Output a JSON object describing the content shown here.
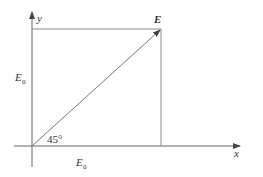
{
  "diagram": {
    "axes": {
      "x_label": "x",
      "y_label": "y"
    },
    "vector": {
      "label": "E",
      "angle_label": "45°"
    },
    "components": {
      "left_label_main": "E",
      "left_label_sub": "0",
      "bottom_label_main": "E",
      "bottom_label_sub": "0"
    },
    "colors": {
      "line": "#8a8a8a",
      "axis": "#555555",
      "text": "#333333"
    }
  }
}
